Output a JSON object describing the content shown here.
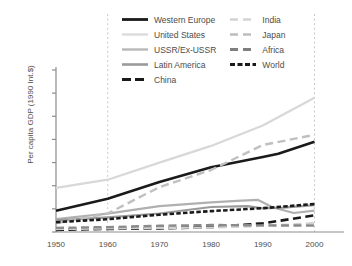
{
  "axis": {
    "ylabel": "Per capita GDP (1990 Int.$)",
    "yticks": [
      "0",
      "5,000",
      "10,000",
      "15,000",
      "20,000",
      "25,000",
      "30,000",
      "35,000"
    ],
    "ytick_values": [
      0,
      5000,
      10000,
      15000,
      20000,
      25000,
      30000,
      35000
    ],
    "xticks": [
      "1950",
      "1960",
      "1970",
      "1980",
      "1990",
      "2000"
    ],
    "xtick_values": [
      1950,
      1960,
      1970,
      1980,
      1990,
      2000
    ]
  },
  "legend": {
    "left_column": [
      {
        "label": "Western Europe",
        "key": "western_europe"
      },
      {
        "label": "United States",
        "key": "united_states"
      },
      {
        "label": "USSR/Ex-USSR",
        "key": "ussr"
      },
      {
        "label": "Latin America",
        "key": "latin_america"
      },
      {
        "label": "China",
        "key": "china"
      }
    ],
    "right_column": [
      {
        "label": "India",
        "key": "india"
      },
      {
        "label": "Japan",
        "key": "japan"
      },
      {
        "label": "Africa",
        "key": "africa"
      },
      {
        "label": "World",
        "key": "world"
      }
    ]
  },
  "chart_data": {
    "type": "line",
    "title": "",
    "xlabel": "",
    "ylabel": "Per capita GDP (1990 Int.$)",
    "xlim": [
      1950,
      2003
    ],
    "ylim": [
      0,
      35000
    ],
    "grid": "vertical-dotted at 1960 and 2000",
    "legend_position": "top-center",
    "x": [
      1950,
      1960,
      1970,
      1980,
      1990,
      2000
    ],
    "series": [
      {
        "name": "Western Europe",
        "color": "#1a1a1a",
        "width": 2.6,
        "dash": "solid",
        "values": [
          4600,
          7200,
          10800,
          14000,
          16200,
          19500
        ]
      },
      {
        "name": "United States",
        "color": "#d8d8d8",
        "width": 2.2,
        "dash": "solid",
        "values": [
          9550,
          11300,
          15000,
          18600,
          23000,
          29000
        ]
      },
      {
        "name": "USSR/Ex-USSR",
        "color": "#b0b0b0",
        "width": 2.2,
        "dash": "solid",
        "values": [
          2800,
          3950,
          5600,
          6400,
          6800,
          4600
        ],
        "note": "peaks near 1989 then declines sharply through the 1990s"
      },
      {
        "name": "Latin America",
        "color": "#9a9a9a",
        "width": 2.2,
        "dash": "solid",
        "values": [
          2500,
          3150,
          4000,
          5400,
          5100,
          5800
        ]
      },
      {
        "name": "China",
        "color": "#1a1a1a",
        "width": 2.6,
        "dash": "dashed",
        "values": [
          450,
          670,
          780,
          1060,
          1860,
          3600
        ]
      },
      {
        "name": "India",
        "color": "#d0d0d0",
        "width": 2.2,
        "dash": "dashed",
        "values": [
          620,
          750,
          870,
          940,
          1300,
          1950
        ]
      },
      {
        "name": "Japan",
        "color": "#c0c0c0",
        "width": 2.4,
        "dash": "dashed",
        "values": [
          1900,
          3990,
          9700,
          13400,
          18800,
          21000
        ]
      },
      {
        "name": "Africa",
        "color": "#8a8a8a",
        "width": 2.4,
        "dash": "dashed",
        "values": [
          890,
          1060,
          1340,
          1520,
          1430,
          1400
        ]
      },
      {
        "name": "World",
        "color": "#1a1a1a",
        "width": 2.6,
        "dash": "dotted-thick",
        "values": [
          2110,
          2770,
          3730,
          4520,
          5150,
          6050
        ]
      }
    ]
  }
}
